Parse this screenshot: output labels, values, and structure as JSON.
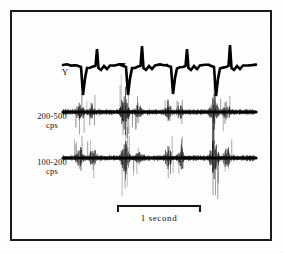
{
  "figure": {
    "kind": "physiological-recording",
    "frame": {
      "stroke_color": "#1b1b1b"
    },
    "background_color": "#ffffff",
    "ink_color": "#000000"
  },
  "labels": {
    "y_channel": "Y",
    "mid_channel_range": "200-500",
    "mid_channel_unit": "cps",
    "low_channel_range": "100-200",
    "low_channel_unit": "cps"
  },
  "scalebar": {
    "caption": "1 second",
    "length_px": 84,
    "represents_seconds": 1
  },
  "chart_data": {
    "type": "line",
    "title": "",
    "subtitle": "",
    "xlabel": "",
    "ylabel": "",
    "grid": false,
    "legend_position": "left-axis-labels",
    "x_axis": {
      "unit": "seconds",
      "scale_bar_seconds": 1,
      "trace_start_px": 63,
      "trace_end_px": 256
    },
    "beat_times_px": [
      83,
      128,
      173,
      216
    ],
    "series": [
      {
        "name": "Y",
        "label": "Y",
        "kind": "ecg-like",
        "baseline_y_px": 65,
        "description": "Slow wave trace with four sharp downward deflections each followed by a tall narrow upward spike",
        "events": [
          {
            "x_px": 83,
            "down_depth_px": 30,
            "up_height_px": 16
          },
          {
            "x_px": 128,
            "down_depth_px": 30,
            "up_height_px": 19
          },
          {
            "x_px": 173,
            "down_depth_px": 29,
            "up_height_px": 16
          },
          {
            "x_px": 216,
            "down_depth_px": 31,
            "up_height_px": 20
          }
        ]
      },
      {
        "name": "200-500 cps",
        "label": "200-500 cps",
        "kind": "noise-burst",
        "baseline_y_px": 112,
        "description": "Band-pass filtered sound channel showing paired burst clusters synchronized with each beat",
        "bursts": [
          {
            "x_px": 80,
            "amplitude_px": 13
          },
          {
            "x_px": 92,
            "amplitude_px": 11
          },
          {
            "x_px": 125,
            "amplitude_px": 22
          },
          {
            "x_px": 138,
            "amplitude_px": 10
          },
          {
            "x_px": 168,
            "amplitude_px": 11
          },
          {
            "x_px": 180,
            "amplitude_px": 9
          },
          {
            "x_px": 214,
            "amplitude_px": 21
          },
          {
            "x_px": 226,
            "amplitude_px": 11
          }
        ],
        "baseline_noise_px": 3
      },
      {
        "name": "100-200 cps",
        "label": "100-200 cps",
        "kind": "noise-burst",
        "baseline_y_px": 158,
        "description": "Lower band sound channel with larger amplitude paired burst clusters synchronized with each beat",
        "bursts": [
          {
            "x_px": 80,
            "amplitude_px": 14
          },
          {
            "x_px": 93,
            "amplitude_px": 13
          },
          {
            "x_px": 125,
            "amplitude_px": 24
          },
          {
            "x_px": 139,
            "amplitude_px": 11
          },
          {
            "x_px": 168,
            "amplitude_px": 13
          },
          {
            "x_px": 181,
            "amplitude_px": 12
          },
          {
            "x_px": 214,
            "amplitude_px": 24
          },
          {
            "x_px": 227,
            "amplitude_px": 12
          }
        ],
        "baseline_noise_px": 3
      }
    ]
  }
}
